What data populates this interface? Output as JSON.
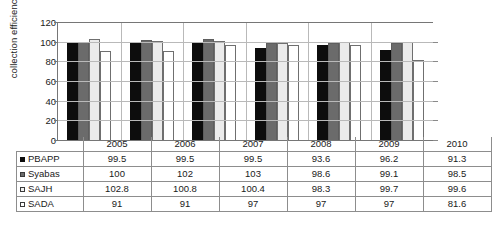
{
  "chart_data": {
    "type": "bar",
    "title": "",
    "xlabel": "",
    "ylabel": "collection efficiency (%)",
    "ylim": [
      0,
      120
    ],
    "yticks": [
      0,
      20,
      40,
      60,
      80,
      100,
      120
    ],
    "grid": true,
    "legend_position": "table-row-headers",
    "categories": [
      "2005",
      "2006",
      "2007",
      "2008",
      "2009",
      "2010"
    ],
    "series": [
      {
        "name": "PBAPP",
        "color": "#0d0d0d",
        "values": [
          99.5,
          99.5,
          99.5,
          93.6,
          96.2,
          91.3
        ]
      },
      {
        "name": "Syabas",
        "color": "#6b6b6b",
        "values": [
          100,
          102,
          103,
          98.6,
          99.1,
          98.5
        ]
      },
      {
        "name": "SAJH",
        "color": "#ebebeb",
        "values": [
          102.8,
          100.8,
          100.4,
          98.3,
          99.7,
          99.6
        ]
      },
      {
        "name": "SADA",
        "color": "#ffffff",
        "values": [
          91,
          91,
          97,
          97,
          97,
          81.6
        ]
      }
    ],
    "table": {
      "corner": "",
      "columns": [
        "2005",
        "2006",
        "2007",
        "2008",
        "2009",
        "2010"
      ],
      "rows": [
        {
          "label": "PBAPP",
          "swatch": "series-marker-pbapp",
          "cells": [
            "99.5",
            "99.5",
            "99.5",
            "93.6",
            "96.2",
            "91.3"
          ]
        },
        {
          "label": "Syabas",
          "swatch": "series-marker-syabas",
          "cells": [
            "100",
            "102",
            "103",
            "98.6",
            "99.1",
            "98.5"
          ]
        },
        {
          "label": "SAJH",
          "swatch": "series-marker-sajh",
          "cells": [
            "102.8",
            "100.8",
            "100.4",
            "98.3",
            "99.7",
            "99.6"
          ]
        },
        {
          "label": "SADA",
          "swatch": "series-marker-sada",
          "cells": [
            "91",
            "91",
            "97",
            "97",
            "97",
            "81.6"
          ]
        }
      ]
    }
  }
}
